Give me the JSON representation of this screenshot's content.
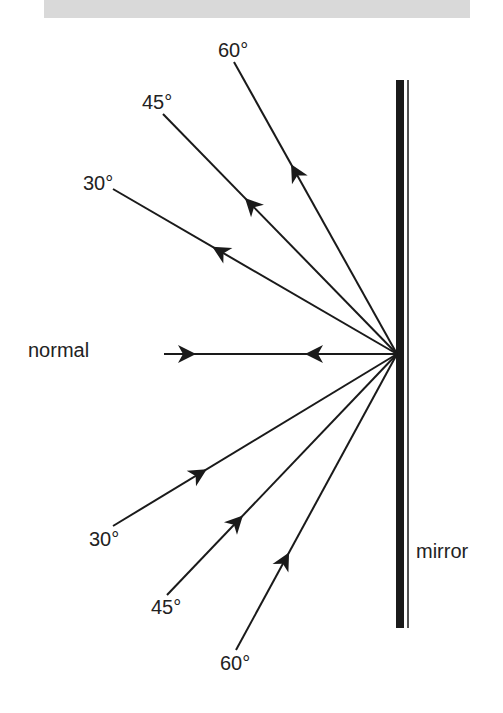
{
  "diagram": {
    "mirror_label": "mirror",
    "normal_label": "normal",
    "reflected_rays": [
      {
        "label": "60°",
        "angle": 60
      },
      {
        "label": "45°",
        "angle": 45
      },
      {
        "label": "30°",
        "angle": 30
      }
    ],
    "incident_rays": [
      {
        "label": "30°",
        "angle": 30
      },
      {
        "label": "45°",
        "angle": 45
      },
      {
        "label": "60°",
        "angle": 60
      }
    ],
    "colors": {
      "line": "#1a1a1a",
      "banner": "#d9d9d9"
    }
  }
}
